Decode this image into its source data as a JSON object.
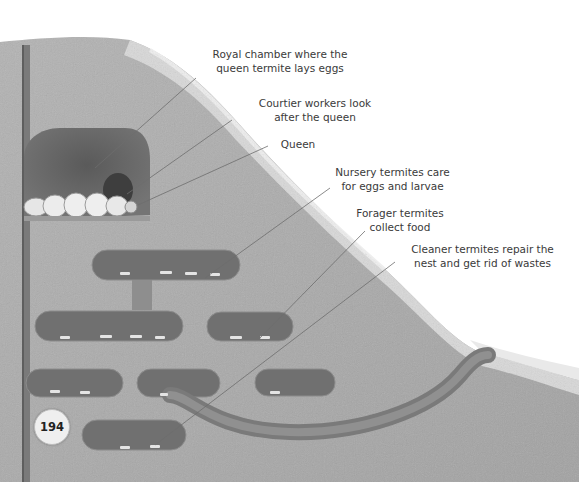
{
  "diagram": {
    "style": "grayscale illustration",
    "colors": {
      "soil": "#a9a9a9",
      "soil_dark": "#8f8f8f",
      "chamber": "#5e5e5e",
      "outer_crust": "#d6d6d6",
      "leader_line": "#6d6d6d",
      "text": "#3a3a3a"
    }
  },
  "labels": [
    {
      "id": "royal-chamber",
      "line1": "Royal chamber where the",
      "line2": "queen termite lays eggs"
    },
    {
      "id": "courtier-workers",
      "line1": "Courtier workers look",
      "line2": "after the queen"
    },
    {
      "id": "queen",
      "line1": "Queen",
      "line2": ""
    },
    {
      "id": "nursery-termites",
      "line1": "Nursery termites care",
      "line2": "for eggs and larvae"
    },
    {
      "id": "forager-termites",
      "line1": "Forager termites",
      "line2": "collect food"
    },
    {
      "id": "cleaner-termites",
      "line1": "Cleaner termites repair the",
      "line2": "nest and get rid of wastes"
    }
  ],
  "page_number": "194"
}
